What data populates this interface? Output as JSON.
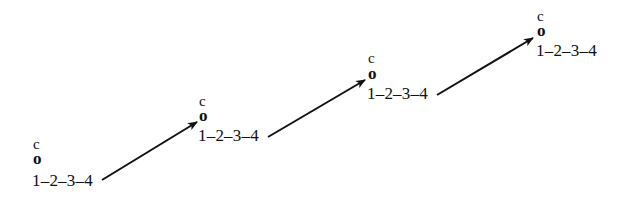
{
  "diagram": {
    "type": "state-sequence",
    "line_color": "#111111",
    "nodes": [
      {
        "top_label": "c",
        "marker": "o",
        "label": "1–2–3–4"
      },
      {
        "top_label": "c",
        "marker": "o",
        "label": "1–2–3–4"
      },
      {
        "top_label": "c",
        "marker": "o",
        "label": "1–2–3–4"
      },
      {
        "top_label": "c",
        "marker": "o",
        "label": "1–2–3–4"
      }
    ],
    "edges": [
      {
        "from": 0,
        "to": 1
      },
      {
        "from": 1,
        "to": 2
      },
      {
        "from": 2,
        "to": 3
      }
    ]
  }
}
